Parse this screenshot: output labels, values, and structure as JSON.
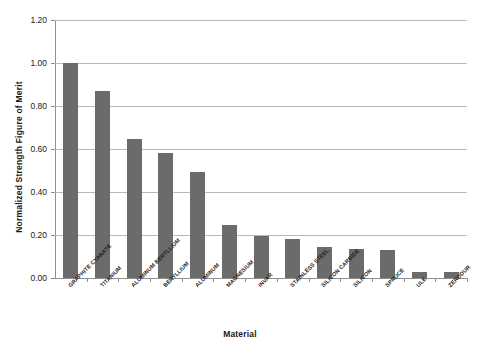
{
  "chart_data": {
    "type": "bar",
    "title": "",
    "xlabel": "Material",
    "ylabel": "Normalized Strength Figure of Merit",
    "ylim": [
      0.0,
      1.2
    ],
    "ytick_labels": [
      "0.00",
      "0.20",
      "0.40",
      "0.60",
      "0.80",
      "1.00",
      "1.20"
    ],
    "ytick_values": [
      0.0,
      0.2,
      0.4,
      0.6,
      0.8,
      1.0,
      1.2
    ],
    "grid": "horizontal",
    "legend": "none",
    "bar_color": "#6b6b6b",
    "categories": [
      "GRAPHITE CYANATE",
      "TITANIUM",
      "ALUMINUM BERYLLIUM",
      "BERYLLIUM",
      "ALUMINUM",
      "MAGNESIUM",
      "INVAR",
      "STAINLESS STEEL",
      "SILICON CARBIDE",
      "SILICON",
      "SPRUCE",
      "ULE",
      "ZERODUR"
    ],
    "values": [
      1.0,
      0.87,
      0.645,
      0.58,
      0.495,
      0.245,
      0.195,
      0.18,
      0.145,
      0.135,
      0.13,
      0.03,
      0.03
    ]
  }
}
